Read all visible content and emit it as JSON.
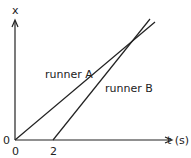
{
  "diagram": {
    "type": "position-time graph",
    "y_axis_label": "x",
    "x_axis_label": "t (s)",
    "origin_y_label": "0",
    "x_ticks": [
      "0",
      "2"
    ],
    "lines": [
      {
        "name": "runner A",
        "start_t": 0,
        "description": "starts at origin, smaller slope"
      },
      {
        "name": "runner B",
        "start_t": 2,
        "description": "starts at t=2, steeper slope, crosses runner A"
      }
    ],
    "line_color": "#222222"
  }
}
